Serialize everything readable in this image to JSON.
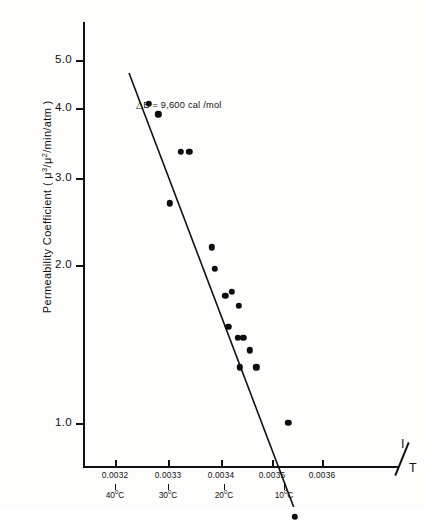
{
  "figure": {
    "y_axis_title": "Permeability Coefficient (",
    "y_axis_title_close": ")",
    "y_unit_mu3": "μ",
    "y_unit_mu3_sup": "3",
    "y_unit_mu2": "μ",
    "y_unit_mu2_sup": "2",
    "y_unit_min": "min",
    "y_unit_atm": "atm",
    "y_unit_full": "Permeability Coefficient ( μ³/μ²/min/atm )",
    "x_axis_title_numerator": "I",
    "x_axis_title_denominator": "T",
    "x_axis_title_full": "1/T",
    "annotation": "△E = 9,600 cal /mol"
  },
  "chart_data": {
    "type": "scatter",
    "title": "",
    "subtitle": "",
    "xlabel": "1/T",
    "ylabel": "Permeability Coefficient ( μ³/μ²/min/atm )",
    "annotations": [
      "△E = 9,600 cal /mol"
    ],
    "grid": false,
    "legend": "none",
    "y_scale": "log",
    "x_scale": "linear",
    "xlim": [
      0.00315,
      0.00365
    ],
    "ylim": [
      0.6,
      5.6
    ],
    "x_tick_labels": [
      "0.0032",
      "0.0033",
      "0.0034",
      "0.0035",
      "0.0036"
    ],
    "x_tick_values": [
      0.0032,
      0.0033,
      0.0034,
      0.0035,
      0.0036
    ],
    "x_secondary_tick_labels": [
      "40°C",
      "30°C",
      "20°C",
      "10°C"
    ],
    "x_secondary_tick_values": [
      0.003193,
      0.0033,
      0.003411,
      0.003532
    ],
    "y_tick_labels": [
      "5.0",
      "4.0",
      "3.0",
      "2.0",
      "1.0"
    ],
    "y_tick_values": [
      5.0,
      4.0,
      3.0,
      2.0,
      1.0
    ],
    "points": [
      {
        "x": 0.003265,
        "y": 4.12
      },
      {
        "x": 0.003283,
        "y": 3.93
      },
      {
        "x": 0.003327,
        "y": 3.33
      },
      {
        "x": 0.003343,
        "y": 3.33
      },
      {
        "x": 0.003306,
        "y": 2.65
      },
      {
        "x": 0.003386,
        "y": 2.18
      },
      {
        "x": 0.003392,
        "y": 1.98
      },
      {
        "x": 0.003412,
        "y": 1.76
      },
      {
        "x": 0.003424,
        "y": 1.79
      },
      {
        "x": 0.003438,
        "y": 1.68
      },
      {
        "x": 0.003418,
        "y": 1.53
      },
      {
        "x": 0.003436,
        "y": 1.46
      },
      {
        "x": 0.003447,
        "y": 1.46
      },
      {
        "x": 0.003459,
        "y": 1.38
      },
      {
        "x": 0.00344,
        "y": 1.28
      },
      {
        "x": 0.003472,
        "y": 1.28
      },
      {
        "x": 0.003533,
        "y": 1.0
      },
      {
        "x": 0.003546,
        "y": 0.66
      }
    ],
    "fit_line": {
      "label": "least-squares fit",
      "x_start": 0.003227,
      "y_start": 4.72,
      "x_end": 0.003552,
      "y_end": 0.655,
      "slope_energy_cal_per_mol": 9600
    }
  }
}
